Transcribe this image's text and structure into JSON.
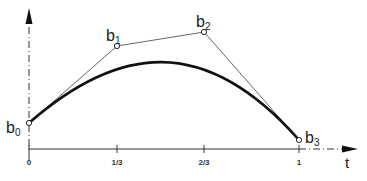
{
  "diagram": {
    "type": "bezier-curve",
    "axis": {
      "x_label": "t",
      "ticks": [
        {
          "label": "0",
          "x": 29
        },
        {
          "label": "1/3",
          "x": 117
        },
        {
          "label": "2/3",
          "x": 204
        },
        {
          "label": "1",
          "x": 299
        }
      ]
    },
    "control_points": [
      {
        "name": "b",
        "sub": "0",
        "x": 29,
        "y": 123
      },
      {
        "name": "b",
        "sub": "1",
        "x": 117,
        "y": 46
      },
      {
        "name": "b",
        "sub": "2",
        "x": 204,
        "y": 32
      },
      {
        "name": "b",
        "sub": "3",
        "x": 299,
        "y": 140
      }
    ],
    "colors": {
      "curve": "#111111",
      "polygon": "#555555",
      "axis": "#333333"
    }
  }
}
